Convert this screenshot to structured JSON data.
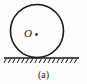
{
  "figure": {
    "caption": "(a)",
    "center_label": "O",
    "center_dot": "center-point-dot",
    "background_color": "#fdfdfc",
    "stroke_color": "#1a1a1a",
    "circle": {
      "name": "disk-outline",
      "cx": 37,
      "cy": 31,
      "r": 26.5,
      "stroke_width": 1.6
    },
    "center_point": {
      "cx": 36.5,
      "cy": 34.5,
      "r": 1.3
    },
    "ground": {
      "name": "ground-surface-line",
      "x_start": 4,
      "x_end": 79,
      "y": 58,
      "stroke_width": 1.4,
      "hatch_count": 17,
      "hatch_length": 4.6,
      "hatch_slant_dx": -2.6,
      "hatch_stroke_width": 1.0
    }
  }
}
